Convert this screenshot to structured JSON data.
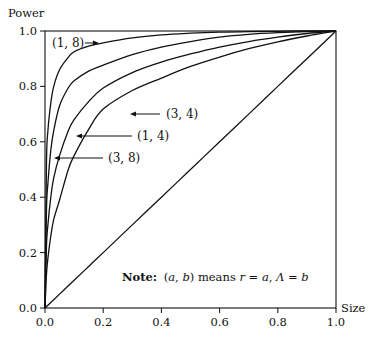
{
  "chart_data": {
    "type": "line",
    "title": "",
    "xlabel": "Size",
    "ylabel": "Power",
    "xlim": [
      0.0,
      1.0
    ],
    "ylim": [
      0.0,
      1.0
    ],
    "grid": false,
    "legend": "none (inline arrow labels)",
    "x_ticks": [
      "0.0",
      "0.2",
      "0.4",
      "0.6",
      "0.8",
      "1.0"
    ],
    "y_ticks": [
      "0.0",
      "0.2",
      "0.4",
      "0.6",
      "0.8",
      "1.0"
    ],
    "x": [
      0.0,
      0.005,
      0.01,
      0.02,
      0.03,
      0.05,
      0.08,
      0.1,
      0.15,
      0.2,
      0.3,
      0.4,
      0.5,
      0.6,
      0.7,
      0.8,
      0.9,
      1.0
    ],
    "series": [
      {
        "name": "(1, 8)",
        "values": [
          0.0,
          0.52,
          0.64,
          0.74,
          0.8,
          0.86,
          0.905,
          0.925,
          0.945,
          0.957,
          0.975,
          0.986,
          0.992,
          0.996,
          0.998,
          0.999,
          1.0,
          1.0
        ]
      },
      {
        "name": "(3, 8)",
        "values": [
          0.0,
          0.35,
          0.45,
          0.57,
          0.64,
          0.73,
          0.795,
          0.82,
          0.855,
          0.877,
          0.915,
          0.942,
          0.962,
          0.978,
          0.988,
          0.994,
          0.998,
          1.0
        ]
      },
      {
        "name": "(1, 4)",
        "values": [
          0.0,
          0.22,
          0.3,
          0.4,
          0.47,
          0.55,
          0.64,
          0.68,
          0.745,
          0.794,
          0.85,
          0.888,
          0.917,
          0.942,
          0.962,
          0.978,
          0.991,
          1.0
        ]
      },
      {
        "name": "(3, 4)",
        "values": [
          0.0,
          0.12,
          0.18,
          0.26,
          0.32,
          0.39,
          0.5,
          0.55,
          0.645,
          0.718,
          0.785,
          0.83,
          0.872,
          0.906,
          0.936,
          0.961,
          0.982,
          1.0
        ]
      },
      {
        "name": "diagonal (power = size)",
        "values": [
          0.0,
          0.005,
          0.01,
          0.02,
          0.03,
          0.05,
          0.08,
          0.1,
          0.15,
          0.2,
          0.3,
          0.4,
          0.5,
          0.6,
          0.7,
          0.8,
          0.9,
          1.0
        ]
      }
    ],
    "annotations": [
      {
        "text": "(1, 8)",
        "arrow": "points right to curve (1, 8)"
      },
      {
        "text": "(3, 4)",
        "arrow": "points left to curve (3, 4)"
      },
      {
        "text": "(1, 4)",
        "arrow": "points left to curve (1, 4)"
      },
      {
        "text": "(3, 8)",
        "arrow": "points left to curve (3, 8)"
      }
    ],
    "note": {
      "bold": "Note:",
      "text_prefix": "(a, b) means r = a, Λ = b"
    }
  },
  "labels": {
    "ylabel": "Power",
    "xlabel": "Size",
    "curve_1_8": "(1, 8)",
    "curve_3_4": "(3, 4)",
    "curve_1_4": "(1, 4)",
    "curve_3_8": "(3, 8)",
    "note_bold": "Note:",
    "note_open": "(",
    "note_a": "a",
    "note_comma": ", ",
    "note_b": "b",
    "note_close": ") means ",
    "note_r": "r",
    "note_eq1": " = ",
    "note_a2": "a",
    "note_comma2": ", ",
    "note_lambda": "Λ",
    "note_eq2": " = ",
    "note_b2": "b"
  },
  "colors": {
    "line": "#111111",
    "background": "#ffffff"
  }
}
